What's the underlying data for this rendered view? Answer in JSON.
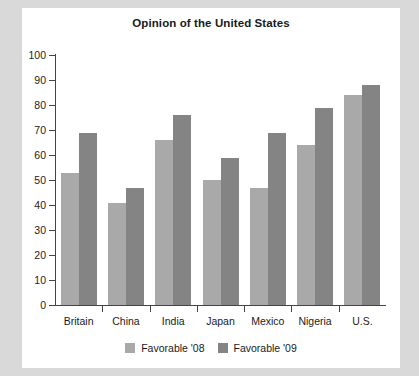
{
  "chart_data": {
    "type": "bar",
    "title": "Opinion of the United States",
    "xlabel": "",
    "ylabel": "",
    "ylim": [
      0,
      100
    ],
    "yticks": [
      0,
      10,
      20,
      30,
      40,
      50,
      60,
      70,
      80,
      90,
      100
    ],
    "grid": false,
    "legend_position": "bottom",
    "categories": [
      "Britain",
      "China",
      "India",
      "Japan",
      "Mexico",
      "Nigeria",
      "U.S."
    ],
    "series": [
      {
        "name": "Favorable '08",
        "color": "#a9a9a9",
        "values": [
          53,
          41,
          66,
          50,
          47,
          64,
          84
        ]
      },
      {
        "name": "Favorable '09",
        "color": "#848484",
        "values": [
          69,
          47,
          76,
          59,
          69,
          79,
          88
        ]
      }
    ]
  },
  "colors": {
    "page_background": "#d9d9d9",
    "card_background": "#ffffff",
    "axis": "#444444",
    "text": "#1a1a1a"
  }
}
